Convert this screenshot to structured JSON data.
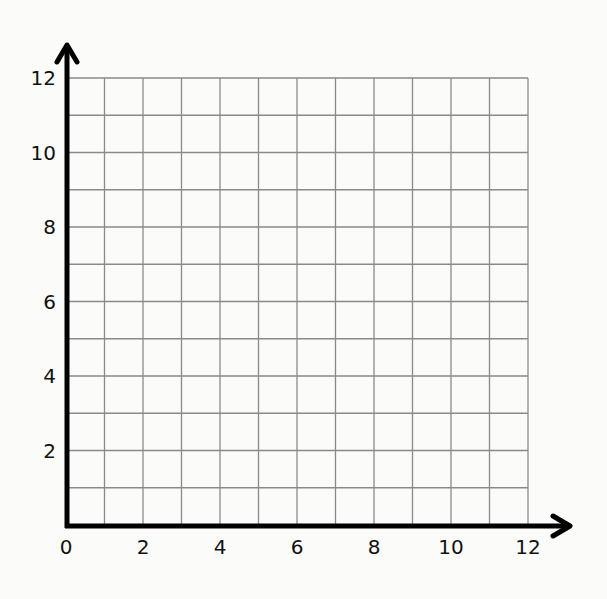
{
  "chart_data": {
    "type": "scatter",
    "title": "",
    "xlabel": "",
    "ylabel": "",
    "xlim": [
      0,
      12
    ],
    "ylim": [
      0,
      12
    ],
    "x_ticks": [
      0,
      2,
      4,
      6,
      8,
      10,
      12
    ],
    "y_ticks": [
      2,
      4,
      6,
      8,
      10,
      12
    ],
    "x_tick_labels": [
      "0",
      "2",
      "4",
      "6",
      "8",
      "10",
      "12"
    ],
    "y_tick_labels": [
      "2",
      "4",
      "6",
      "8",
      "10",
      "12"
    ],
    "grid": true,
    "grid_step": 1,
    "series": [],
    "legend": null,
    "axes_arrows": true
  },
  "colors": {
    "axis": "#000000",
    "grid": "#8a8a8a",
    "background": "#fbfbfa"
  }
}
